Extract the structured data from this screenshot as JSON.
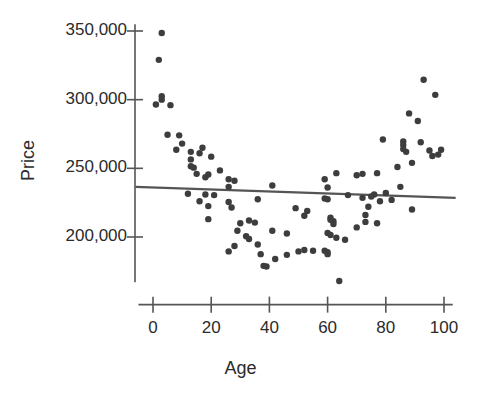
{
  "chart_data": {
    "type": "scatter",
    "title": "",
    "xlabel": "Age",
    "ylabel": "Price",
    "xlim": [
      -5,
      104
    ],
    "ylim": [
      160000,
      357000
    ],
    "grid": false,
    "legend": "none",
    "x_ticks": [
      0,
      20,
      40,
      60,
      80,
      100
    ],
    "x_tick_labels": [
      "0",
      "20",
      "40",
      "60",
      "80",
      "100"
    ],
    "y_ticks": [
      200000,
      250000,
      300000,
      350000
    ],
    "y_tick_labels": [
      "200,000",
      "250,000",
      "300,000",
      "350,000"
    ],
    "marker_color": "#3d3d3d",
    "marker_size": 3.2,
    "axis_color": "#555555",
    "trendline": {
      "type": "linear-fit",
      "color": "#555555",
      "width": 2.2,
      "x_start": -6,
      "y_start": 236500,
      "x_end": 104,
      "y_end": 228500
    },
    "points": [
      {
        "x": 3,
        "y": 348500
      },
      {
        "x": 2,
        "y": 329000
      },
      {
        "x": 3,
        "y": 302500
      },
      {
        "x": 3,
        "y": 300000
      },
      {
        "x": 1,
        "y": 296500
      },
      {
        "x": 6,
        "y": 296000
      },
      {
        "x": 5,
        "y": 274500
      },
      {
        "x": 9,
        "y": 274000
      },
      {
        "x": 10,
        "y": 268000
      },
      {
        "x": 8,
        "y": 263500
      },
      {
        "x": 13,
        "y": 262000
      },
      {
        "x": 16,
        "y": 261000
      },
      {
        "x": 17,
        "y": 265000
      },
      {
        "x": 13,
        "y": 256500
      },
      {
        "x": 20,
        "y": 258500
      },
      {
        "x": 13,
        "y": 251500
      },
      {
        "x": 14,
        "y": 250500
      },
      {
        "x": 15,
        "y": 246000
      },
      {
        "x": 19,
        "y": 245500
      },
      {
        "x": 18,
        "y": 243500
      },
      {
        "x": 23,
        "y": 248500
      },
      {
        "x": 26,
        "y": 242000
      },
      {
        "x": 28,
        "y": 241000
      },
      {
        "x": 26,
        "y": 236500
      },
      {
        "x": 41,
        "y": 237500
      },
      {
        "x": 12,
        "y": 231500
      },
      {
        "x": 18,
        "y": 231000
      },
      {
        "x": 21,
        "y": 230500
      },
      {
        "x": 36,
        "y": 227500
      },
      {
        "x": 60,
        "y": 236000
      },
      {
        "x": 59,
        "y": 242000
      },
      {
        "x": 63,
        "y": 246500
      },
      {
        "x": 70,
        "y": 245000
      },
      {
        "x": 72,
        "y": 246000
      },
      {
        "x": 77,
        "y": 246500
      },
      {
        "x": 16,
        "y": 226000
      },
      {
        "x": 19,
        "y": 222500
      },
      {
        "x": 26,
        "y": 225500
      },
      {
        "x": 27,
        "y": 221500
      },
      {
        "x": 49,
        "y": 221000
      },
      {
        "x": 53,
        "y": 219000
      },
      {
        "x": 59,
        "y": 228000
      },
      {
        "x": 60,
        "y": 227500
      },
      {
        "x": 67,
        "y": 230500
      },
      {
        "x": 72,
        "y": 228500
      },
      {
        "x": 75,
        "y": 229500
      },
      {
        "x": 76,
        "y": 231000
      },
      {
        "x": 80,
        "y": 232000
      },
      {
        "x": 78,
        "y": 226000
      },
      {
        "x": 74,
        "y": 222000
      },
      {
        "x": 19,
        "y": 213000
      },
      {
        "x": 30,
        "y": 210000
      },
      {
        "x": 33,
        "y": 212000
      },
      {
        "x": 35,
        "y": 210500
      },
      {
        "x": 41,
        "y": 204500
      },
      {
        "x": 46,
        "y": 202500
      },
      {
        "x": 52,
        "y": 215500
      },
      {
        "x": 61,
        "y": 214000
      },
      {
        "x": 61,
        "y": 212500
      },
      {
        "x": 62,
        "y": 211500
      },
      {
        "x": 62,
        "y": 209500
      },
      {
        "x": 70,
        "y": 207000
      },
      {
        "x": 73,
        "y": 216000
      },
      {
        "x": 73,
        "y": 211000
      },
      {
        "x": 77,
        "y": 210000
      },
      {
        "x": 29,
        "y": 204500
      },
      {
        "x": 32,
        "y": 200500
      },
      {
        "x": 33,
        "y": 198500
      },
      {
        "x": 36,
        "y": 194500
      },
      {
        "x": 60,
        "y": 203000
      },
      {
        "x": 61,
        "y": 201500
      },
      {
        "x": 63,
        "y": 199500
      },
      {
        "x": 66,
        "y": 198000
      },
      {
        "x": 28,
        "y": 193500
      },
      {
        "x": 26,
        "y": 189500
      },
      {
        "x": 37,
        "y": 187500
      },
      {
        "x": 42,
        "y": 184000
      },
      {
        "x": 46,
        "y": 187000
      },
      {
        "x": 50,
        "y": 189500
      },
      {
        "x": 52,
        "y": 190500
      },
      {
        "x": 55,
        "y": 190000
      },
      {
        "x": 59,
        "y": 190000
      },
      {
        "x": 60,
        "y": 189000
      },
      {
        "x": 60,
        "y": 187500
      },
      {
        "x": 38,
        "y": 179000
      },
      {
        "x": 39,
        "y": 178500
      },
      {
        "x": 64,
        "y": 168000
      },
      {
        "x": 79,
        "y": 271000
      },
      {
        "x": 84,
        "y": 251000
      },
      {
        "x": 85,
        "y": 236500
      },
      {
        "x": 82,
        "y": 227000
      },
      {
        "x": 86,
        "y": 269500
      },
      {
        "x": 86,
        "y": 267000
      },
      {
        "x": 86,
        "y": 264000
      },
      {
        "x": 88,
        "y": 290000
      },
      {
        "x": 87,
        "y": 262000
      },
      {
        "x": 89,
        "y": 254000
      },
      {
        "x": 89,
        "y": 220000
      },
      {
        "x": 91,
        "y": 284500
      },
      {
        "x": 92,
        "y": 269000
      },
      {
        "x": 93,
        "y": 314500
      },
      {
        "x": 95,
        "y": 263000
      },
      {
        "x": 96,
        "y": 259000
      },
      {
        "x": 97,
        "y": 303500
      },
      {
        "x": 98,
        "y": 260000
      },
      {
        "x": 99,
        "y": 263500
      }
    ]
  }
}
